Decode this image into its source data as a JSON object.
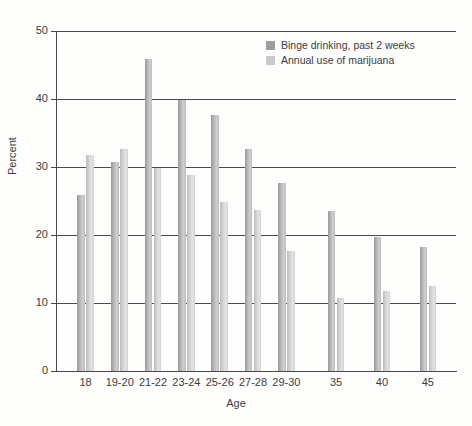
{
  "chart_data": {
    "type": "bar",
    "title": "",
    "xlabel": "Age",
    "ylabel": "Percent",
    "ylim": [
      0,
      50
    ],
    "yticks": [
      0,
      10,
      20,
      30,
      40,
      50
    ],
    "grid": true,
    "legend_position": "top-right",
    "categories": [
      "18",
      "19-20",
      "21-22",
      "23-24",
      "25-26",
      "27-28",
      "29-30",
      "35",
      "40",
      "45"
    ],
    "series": [
      {
        "name": "Binge drinking, past 2 weeks",
        "color": "#9d9d9d",
        "values": [
          25.9,
          30.8,
          45.9,
          39.8,
          37.6,
          32.6,
          27.7,
          23.5,
          19.7,
          18.3
        ]
      },
      {
        "name": "Annual use of marijuana",
        "color": "#c9c9c9",
        "values": [
          31.8,
          32.6,
          29.8,
          28.8,
          24.9,
          23.7,
          17.6,
          10.8,
          11.7,
          12.5
        ]
      }
    ]
  }
}
